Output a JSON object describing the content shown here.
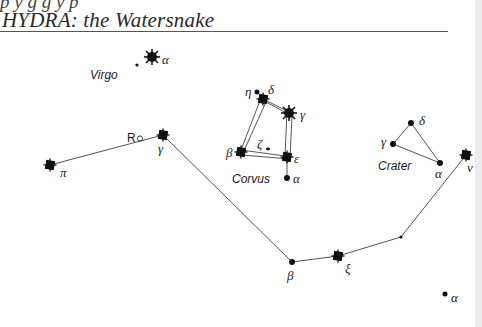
{
  "header": {
    "cut_text": "p y g g y p",
    "title": "HYDRA: the Watersnake"
  },
  "constellations": {
    "virgo": {
      "name": "Virgo",
      "stars": [
        {
          "label": "α",
          "x": 152,
          "y": 57,
          "type": "bright"
        },
        {
          "label": "",
          "x": 137,
          "y": 65,
          "type": "tiny"
        }
      ]
    },
    "hydra": {
      "stars": [
        {
          "label": "π",
          "x": 50,
          "y": 165,
          "type": "bright"
        },
        {
          "label": "γ",
          "x": 163,
          "y": 135,
          "type": "bright"
        },
        {
          "label": "β",
          "x": 292,
          "y": 262,
          "type": "dot"
        },
        {
          "label": "ξ",
          "x": 338,
          "y": 256,
          "type": "bright"
        },
        {
          "label": "",
          "x": 401,
          "y": 237,
          "type": "tiny"
        },
        {
          "label": "ν",
          "x": 466,
          "y": 155,
          "type": "bright"
        }
      ],
      "variable_marker": "R"
    },
    "corvus": {
      "name": "Corvus",
      "stars": [
        {
          "label": "η",
          "x": 257,
          "y": 92,
          "type": "dot"
        },
        {
          "label": "δ",
          "x": 263,
          "y": 99,
          "type": "bright"
        },
        {
          "label": "γ",
          "x": 289,
          "y": 113,
          "type": "bright"
        },
        {
          "label": "ε",
          "x": 287,
          "y": 157,
          "type": "bright"
        },
        {
          "label": "β",
          "x": 241,
          "y": 152,
          "type": "bright"
        },
        {
          "label": "ζ",
          "x": 268,
          "y": 149,
          "type": "tiny"
        },
        {
          "label": "α",
          "x": 287,
          "y": 178,
          "type": "dot"
        }
      ]
    },
    "crater": {
      "name": "Crater",
      "stars": [
        {
          "label": "δ",
          "x": 411,
          "y": 123,
          "type": "dot"
        },
        {
          "label": "γ",
          "x": 393,
          "y": 144,
          "type": "dot"
        },
        {
          "label": "α",
          "x": 440,
          "y": 163,
          "type": "dot"
        }
      ]
    },
    "lone": {
      "stars": [
        {
          "label": "α",
          "x": 445,
          "y": 294,
          "type": "dot"
        }
      ]
    }
  },
  "colors": {
    "ink": "#111111",
    "line": "#555555",
    "background": "#ffffff",
    "edge": "#ececec"
  }
}
